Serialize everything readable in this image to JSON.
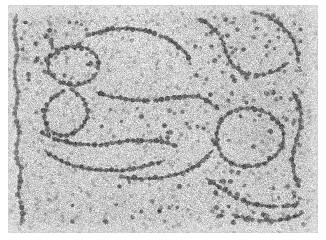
{
  "figure": {
    "kind": "electron-micrograph",
    "modality": "transmission electron microscopy, negative stain",
    "caption": "",
    "scale_bar_label": "",
    "has_text_labels": false,
    "has_scale_bar": false
  },
  "page": {
    "width": 326,
    "height": 240,
    "background_color": "#ffffff"
  },
  "image_area": {
    "x": 8,
    "y": 5,
    "width": 310,
    "height": 228,
    "background_color": "#c9c9c9",
    "border": "none"
  },
  "appearance": {
    "background_mean_gray": "#c9c9c9",
    "background_noise_light": "#e8e8e8",
    "background_noise_dark": "#a6a6a6",
    "bead_core_color": "#5e5e5e",
    "bead_mid_color": "#767676",
    "bead_rim_color": "#9a9a9a",
    "filament_color": "#8e8e8e",
    "grain_density": 0.55,
    "grain_pixel_size": 1
  },
  "structure": {
    "bead_diameter_px": 3.6,
    "bead_spacing_px": 5.2,
    "filament_width_px": 1.1,
    "bead_count_estimate": 760,
    "free_particle_count_estimate": 210,
    "fiber_count": 14
  },
  "fibers": [
    {
      "id": "fiber-left-edge",
      "label": "left vertical fiber",
      "points": [
        [
          16,
          14
        ],
        [
          14,
          32
        ],
        [
          17,
          52
        ],
        [
          14,
          70
        ],
        [
          17,
          92
        ],
        [
          15,
          112
        ],
        [
          18,
          132
        ],
        [
          16,
          152
        ],
        [
          20,
          172
        ],
        [
          18,
          192
        ],
        [
          22,
          210
        ],
        [
          20,
          224
        ]
      ]
    },
    {
      "id": "fiber-upper-left-loop",
      "label": "upper-left open loop",
      "points": [
        [
          48,
          58
        ],
        [
          58,
          50
        ],
        [
          72,
          46
        ],
        [
          86,
          48
        ],
        [
          96,
          56
        ],
        [
          98,
          68
        ],
        [
          92,
          78
        ],
        [
          80,
          84
        ],
        [
          66,
          84
        ],
        [
          54,
          78
        ],
        [
          48,
          68
        ],
        [
          48,
          58
        ]
      ]
    },
    {
      "id": "fiber-upper-mid-arc",
      "label": "upper middle arc",
      "points": [
        [
          86,
          36
        ],
        [
          104,
          30
        ],
        [
          124,
          28
        ],
        [
          144,
          30
        ],
        [
          162,
          36
        ],
        [
          176,
          44
        ],
        [
          186,
          54
        ],
        [
          190,
          64
        ]
      ]
    },
    {
      "id": "fiber-top-right-chain",
      "label": "top right descending chain",
      "points": [
        [
          196,
          18
        ],
        [
          208,
          24
        ],
        [
          218,
          34
        ],
        [
          224,
          46
        ],
        [
          228,
          58
        ],
        [
          236,
          68
        ],
        [
          248,
          74
        ],
        [
          262,
          74
        ],
        [
          276,
          70
        ],
        [
          288,
          62
        ]
      ]
    },
    {
      "id": "fiber-top-far-right",
      "label": "top far-right fiber",
      "points": [
        [
          250,
          12
        ],
        [
          262,
          14
        ],
        [
          274,
          20
        ],
        [
          284,
          28
        ],
        [
          292,
          38
        ],
        [
          296,
          50
        ],
        [
          298,
          62
        ]
      ]
    },
    {
      "id": "fiber-center-diagonal",
      "label": "central diagonal fiber",
      "points": [
        [
          96,
          92
        ],
        [
          110,
          96
        ],
        [
          124,
          98
        ],
        [
          138,
          100
        ],
        [
          152,
          100
        ],
        [
          166,
          98
        ],
        [
          180,
          96
        ],
        [
          194,
          96
        ],
        [
          206,
          100
        ],
        [
          216,
          108
        ]
      ]
    },
    {
      "id": "fiber-center-cluster",
      "label": "dense central cluster",
      "points": [
        [
          70,
          88
        ],
        [
          80,
          96
        ],
        [
          86,
          106
        ],
        [
          86,
          118
        ],
        [
          80,
          128
        ],
        [
          70,
          134
        ],
        [
          58,
          134
        ],
        [
          48,
          128
        ],
        [
          44,
          118
        ],
        [
          46,
          106
        ],
        [
          54,
          96
        ],
        [
          64,
          90
        ]
      ]
    },
    {
      "id": "fiber-mid-sweep",
      "label": "mid sweeping fiber",
      "points": [
        [
          40,
          132
        ],
        [
          54,
          138
        ],
        [
          68,
          142
        ],
        [
          84,
          144
        ],
        [
          100,
          144
        ],
        [
          116,
          142
        ],
        [
          132,
          140
        ],
        [
          148,
          140
        ],
        [
          164,
          142
        ],
        [
          178,
          146
        ]
      ]
    },
    {
      "id": "fiber-lower-left-arc",
      "label": "lower-left arc",
      "points": [
        [
          44,
          150
        ],
        [
          56,
          158
        ],
        [
          70,
          164
        ],
        [
          86,
          168
        ],
        [
          102,
          170
        ],
        [
          118,
          170
        ],
        [
          134,
          168
        ],
        [
          150,
          164
        ],
        [
          164,
          160
        ]
      ]
    },
    {
      "id": "fiber-lower-mid",
      "label": "lower middle chain",
      "points": [
        [
          120,
          176
        ],
        [
          136,
          178
        ],
        [
          152,
          178
        ],
        [
          168,
          176
        ],
        [
          182,
          172
        ],
        [
          194,
          166
        ],
        [
          204,
          158
        ],
        [
          212,
          150
        ]
      ]
    },
    {
      "id": "fiber-right-loop",
      "label": "right large loop",
      "points": [
        [
          228,
          112
        ],
        [
          244,
          108
        ],
        [
          260,
          110
        ],
        [
          274,
          118
        ],
        [
          282,
          130
        ],
        [
          282,
          144
        ],
        [
          274,
          156
        ],
        [
          260,
          164
        ],
        [
          244,
          166
        ],
        [
          230,
          162
        ],
        [
          220,
          152
        ],
        [
          216,
          140
        ],
        [
          218,
          126
        ],
        [
          228,
          112
        ]
      ]
    },
    {
      "id": "fiber-right-edge",
      "label": "right edge fiber",
      "points": [
        [
          292,
          92
        ],
        [
          298,
          104
        ],
        [
          300,
          118
        ],
        [
          298,
          132
        ],
        [
          294,
          146
        ],
        [
          292,
          160
        ],
        [
          294,
          174
        ],
        [
          298,
          186
        ]
      ]
    },
    {
      "id": "fiber-bottom-right",
      "label": "bottom right chain",
      "points": [
        [
          206,
          178
        ],
        [
          218,
          186
        ],
        [
          230,
          194
        ],
        [
          242,
          200
        ],
        [
          256,
          204
        ],
        [
          270,
          206
        ],
        [
          284,
          206
        ],
        [
          298,
          204
        ]
      ]
    },
    {
      "id": "fiber-bottom-right-2",
      "label": "bottom right lower chain",
      "points": [
        [
          232,
          214
        ],
        [
          246,
          218
        ],
        [
          260,
          220
        ],
        [
          274,
          220
        ],
        [
          288,
          218
        ],
        [
          300,
          214
        ]
      ]
    }
  ],
  "free_particle_clusters": [
    {
      "label": "upper-left scatter",
      "x": 20,
      "y": 20,
      "w": 70,
      "h": 60,
      "count": 34
    },
    {
      "label": "upper-right scatter",
      "x": 190,
      "y": 14,
      "w": 110,
      "h": 70,
      "count": 46
    },
    {
      "label": "mid-right scatter",
      "x": 200,
      "y": 90,
      "w": 100,
      "h": 60,
      "count": 30
    },
    {
      "label": "bottom-right scatter",
      "x": 210,
      "y": 170,
      "w": 95,
      "h": 55,
      "count": 40
    },
    {
      "label": "lower-center sparse",
      "x": 60,
      "y": 180,
      "w": 120,
      "h": 45,
      "count": 16
    },
    {
      "label": "center sparse",
      "x": 100,
      "y": 105,
      "w": 100,
      "h": 40,
      "count": 18
    }
  ]
}
